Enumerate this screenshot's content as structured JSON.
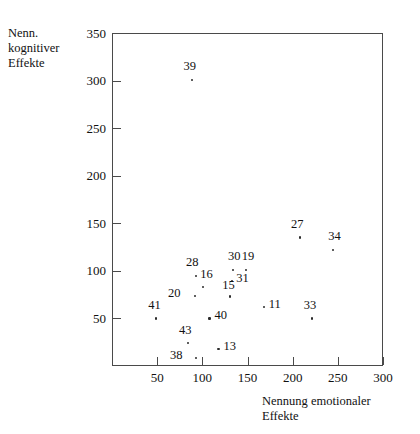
{
  "chart_data": {
    "type": "scatter",
    "title": "",
    "xlabel": "Nennung emotionaler Effekte",
    "xlabel_lines": [
      "Nennung emotionaler",
      "Effekte"
    ],
    "ylabel": "Nenn. kognitiver Effekte",
    "ylabel_lines": [
      "Nenn.",
      "kognitiver",
      "Effekte"
    ],
    "xlim": [
      0,
      300
    ],
    "ylim": [
      0,
      350
    ],
    "xticks": [
      50,
      100,
      150,
      200,
      250,
      300
    ],
    "yticks": [
      50,
      100,
      150,
      200,
      250,
      300,
      350
    ],
    "grid": false,
    "legend": "none",
    "marker_color": "#2b2b2b",
    "axis_color": "#4a4a4a",
    "points": [
      {
        "label": "39",
        "x": 89,
        "y": 301,
        "lx": -9,
        "ly": -20
      },
      {
        "label": "27",
        "x": 208,
        "y": 135,
        "lx": -9,
        "ly": -20
      },
      {
        "label": "34",
        "x": 245,
        "y": 122,
        "lx": -5,
        "ly": -20
      },
      {
        "label": "28",
        "x": 93,
        "y": 95,
        "lx": -10,
        "ly": -20
      },
      {
        "label": "30",
        "x": 134,
        "y": 101,
        "lx": -5,
        "ly": -20
      },
      {
        "label": "19",
        "x": 148,
        "y": 101,
        "lx": -4,
        "ly": -20
      },
      {
        "label": "16",
        "x": 101,
        "y": 83,
        "lx": -3,
        "ly": -19
      },
      {
        "label": "31",
        "x": 133,
        "y": 89,
        "lx": 4,
        "ly": -9
      },
      {
        "label": "20",
        "x": 92,
        "y": 74,
        "lx": -27,
        "ly": -9
      },
      {
        "label": "15",
        "x": 131,
        "y": 73,
        "lx": -8,
        "ly": -18
      },
      {
        "label": "11",
        "x": 168,
        "y": 62,
        "lx": 5,
        "ly": -9
      },
      {
        "label": "41",
        "x": 49,
        "y": 50,
        "lx": -8,
        "ly": -19
      },
      {
        "label": "40",
        "x": 108,
        "y": 50,
        "lx": 5,
        "ly": -9
      },
      {
        "label": "33",
        "x": 221,
        "y": 50,
        "lx": -8,
        "ly": -19
      },
      {
        "label": "43",
        "x": 84,
        "y": 24,
        "lx": -9,
        "ly": -19
      },
      {
        "label": "13",
        "x": 118,
        "y": 18,
        "lx": 5,
        "ly": -9
      },
      {
        "label": "38",
        "x": 93,
        "y": 8,
        "lx": -26,
        "ly": -9
      }
    ]
  }
}
